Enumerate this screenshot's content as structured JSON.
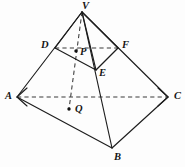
{
  "figure": {
    "canvas": {
      "width": 185,
      "height": 167
    },
    "background_color": "#fdfdfd",
    "stroke_color": "#1d1d1d",
    "dashed_color": "#3a3a3a",
    "label_color": "#151515",
    "points": [
      {
        "id": "V",
        "label": "V",
        "x": 82,
        "y": 12,
        "kind": "apex",
        "dot": false
      },
      {
        "id": "D",
        "label": "D",
        "x": 55,
        "y": 48,
        "kind": "vertex",
        "dot": false
      },
      {
        "id": "F",
        "label": "F",
        "x": 118,
        "y": 48,
        "kind": "vertex",
        "dot": false
      },
      {
        "id": "P",
        "label": "P",
        "x": 76,
        "y": 51,
        "kind": "marked",
        "dot": true
      },
      {
        "id": "E",
        "label": "E",
        "x": 96,
        "y": 70,
        "kind": "vertex",
        "dot": false
      },
      {
        "id": "A",
        "label": "A",
        "x": 17,
        "y": 97,
        "kind": "vertex",
        "dot": false
      },
      {
        "id": "C",
        "label": "C",
        "x": 168,
        "y": 97,
        "kind": "vertex",
        "dot": false
      },
      {
        "id": "Q",
        "label": "Q",
        "x": 69,
        "y": 109,
        "kind": "marked",
        "dot": true
      },
      {
        "id": "B",
        "label": "B",
        "x": 112,
        "y": 148,
        "kind": "vertex",
        "dot": false
      }
    ],
    "edges_solid": [
      {
        "from": "V",
        "to": "A",
        "name": "edge-VA"
      },
      {
        "from": "V",
        "to": "C",
        "name": "edge-VC"
      },
      {
        "from": "V",
        "to": "B",
        "name": "edge-VB"
      },
      {
        "from": "V",
        "to": "D",
        "name": "edge-VD"
      },
      {
        "from": "V",
        "to": "F",
        "name": "edge-VF"
      },
      {
        "from": "V",
        "to": "E",
        "name": "edge-VE"
      },
      {
        "from": "D",
        "to": "E",
        "name": "edge-DE"
      },
      {
        "from": "E",
        "to": "F",
        "name": "edge-EF"
      },
      {
        "from": "A",
        "to": "B",
        "name": "edge-AB"
      },
      {
        "from": "B",
        "to": "C",
        "name": "edge-BC"
      }
    ],
    "edges_dashed": [
      {
        "from": "A",
        "to": "C",
        "name": "edge-AC-hidden"
      },
      {
        "from": "D",
        "to": "F",
        "name": "edge-DF-hidden"
      },
      {
        "from": "V",
        "to": "Q",
        "name": "edge-VQ-axis"
      }
    ],
    "labels": {
      "V": "V",
      "D": "D",
      "F": "F",
      "P": "P",
      "E": "E",
      "A": "A",
      "C": "C",
      "Q": "Q",
      "B": "B"
    }
  }
}
